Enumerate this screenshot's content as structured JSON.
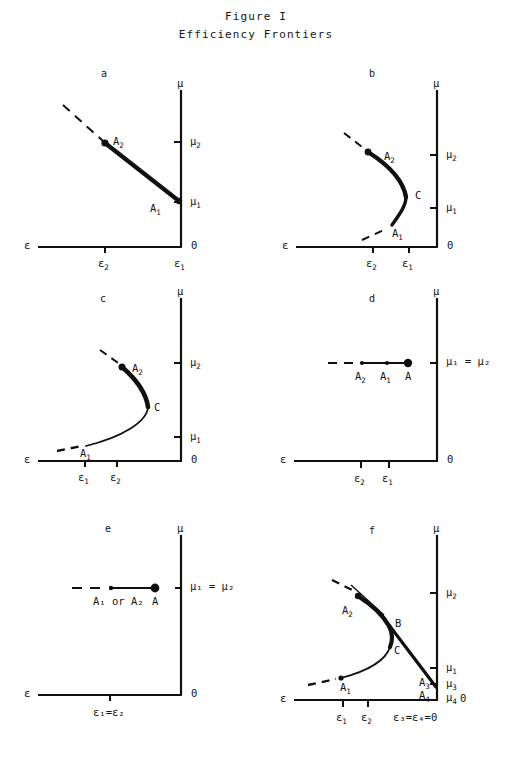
{
  "figure": {
    "title_line1": "Figure I",
    "title_line2": "Efficiency Frontiers"
  },
  "axis_labels": {
    "epsilon": "ε",
    "mu": "μ",
    "origin": "0"
  },
  "panels": [
    {
      "letter": "a",
      "x_ticks": [
        {
          "label": "ε",
          "sub": "2"
        },
        {
          "label": "ε",
          "sub": "1"
        }
      ],
      "y_ticks": [
        {
          "label": "μ",
          "sub": "2"
        },
        {
          "label": "μ",
          "sub": "1"
        }
      ],
      "point_labels": [
        {
          "label": "A",
          "sub": "2"
        },
        {
          "label": "A",
          "sub": "1"
        }
      ],
      "description": "straight thick downward-sloping frontier from A2 to A1 with dashed extension up-left"
    },
    {
      "letter": "b",
      "x_ticks": [
        {
          "label": "ε",
          "sub": "2"
        },
        {
          "label": "ε",
          "sub": "1"
        }
      ],
      "y_ticks": [
        {
          "label": "μ",
          "sub": "2"
        },
        {
          "label": "μ",
          "sub": "1"
        }
      ],
      "point_labels": [
        {
          "label": "A",
          "sub": "2"
        },
        {
          "label": "C",
          "sub": ""
        },
        {
          "label": "A",
          "sub": "1"
        }
      ],
      "description": "backward-bending thick curve bulging right, vertex C, dashed tails both ends"
    },
    {
      "letter": "c",
      "x_ticks": [
        {
          "label": "ε",
          "sub": "1"
        },
        {
          "label": "ε",
          "sub": "2"
        }
      ],
      "y_ticks": [
        {
          "label": "μ",
          "sub": "2"
        },
        {
          "label": "μ",
          "sub": "1"
        }
      ],
      "point_labels": [
        {
          "label": "A",
          "sub": "2"
        },
        {
          "label": "C",
          "sub": ""
        },
        {
          "label": "A",
          "sub": "1"
        }
      ],
      "description": "curve thick from A2 to C then thin down-left to A1, dashed tails both ends"
    },
    {
      "letter": "d",
      "x_ticks": [
        {
          "label": "ε",
          "sub": "2"
        },
        {
          "label": "ε",
          "sub": "1"
        }
      ],
      "y_ticks": [
        {
          "label": "μ",
          "sub": "1",
          "equals": "= μ",
          "equals_sub": "2"
        }
      ],
      "y_tick_text": "μ₁ = μ₂",
      "point_labels": [
        {
          "label": "A",
          "sub": "2"
        },
        {
          "label": "A",
          "sub": "1"
        },
        {
          "label": "A",
          "sub": ""
        }
      ],
      "description": "horizontal frontier at mu1=mu2 with dots A2, A1 and filled dot A, dashed tail left"
    },
    {
      "letter": "e",
      "x_ticks": [
        {
          "label": "ε₁=ε₂",
          "sub": ""
        }
      ],
      "y_ticks": [
        {
          "label": "μ₁ = μ₂",
          "sub": ""
        }
      ],
      "point_labels": [
        {
          "label": "A₁ or A₂",
          "sub": ""
        },
        {
          "label": "A",
          "sub": ""
        }
      ],
      "description": "horizontal frontier at mu1=mu2, single coincident point A, dashed tail left"
    },
    {
      "letter": "f",
      "x_ticks": [
        {
          "label": "ε",
          "sub": "1"
        },
        {
          "label": "ε",
          "sub": "2"
        },
        {
          "label": "ε₃=ε₄=0",
          "sub": ""
        }
      ],
      "y_ticks": [
        {
          "label": "μ",
          "sub": "2"
        },
        {
          "label": "μ",
          "sub": "1"
        },
        {
          "label": "μ",
          "sub": "3"
        },
        {
          "label": "μ",
          "sub": "4"
        }
      ],
      "point_labels": [
        {
          "label": "A",
          "sub": "2"
        },
        {
          "label": "B",
          "sub": ""
        },
        {
          "label": "C",
          "sub": ""
        },
        {
          "label": "A",
          "sub": "1"
        },
        {
          "label": "A",
          "sub": "3"
        },
        {
          "label": "A",
          "sub": "4"
        }
      ],
      "description": "backward-bending curve A2-C-A1 plus straight thick chord from B down to A3 at the mu axis"
    }
  ]
}
